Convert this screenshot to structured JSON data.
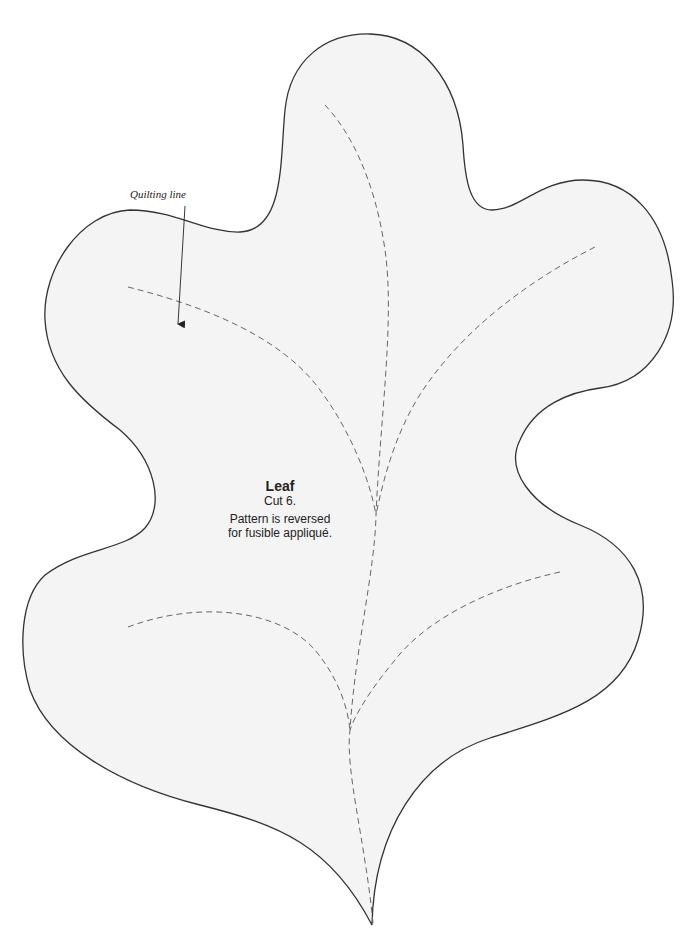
{
  "pattern": {
    "title": "Leaf",
    "cut_instruction": "Cut 6.",
    "note_line1": "Pattern is reversed",
    "note_line2": "for fusible appliqué."
  },
  "callout": {
    "label": "Quilting line"
  },
  "colors": {
    "fill": "#f4f4f4",
    "outline": "#333333",
    "quilting_line": "#666666",
    "background": "#ffffff"
  }
}
